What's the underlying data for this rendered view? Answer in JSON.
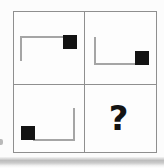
{
  "figure": {
    "type": "matrix-puzzle",
    "grid": {
      "rows": 2,
      "cols": 2
    },
    "cells": [
      {
        "position": "top-left",
        "bracket_sides": "top-and-left",
        "square_location": "right end of top line, hanging below it"
      },
      {
        "position": "top-right",
        "bracket_sides": "left-and-bottom",
        "square_location": "right end of bottom line, sitting on it"
      },
      {
        "position": "bottom-left",
        "bracket_sides": "right-and-bottom",
        "square_location": "left end of bottom line, sitting on it"
      },
      {
        "position": "bottom-right",
        "mark": "?"
      }
    ],
    "colors": {
      "background": "#fcfcfc",
      "grid_line": "#8f8f8f",
      "bracket_line": "#a5a5a5",
      "black_square": "#131313",
      "question_mark": "#141414",
      "scan_shadow": "#a8a8a8"
    }
  }
}
